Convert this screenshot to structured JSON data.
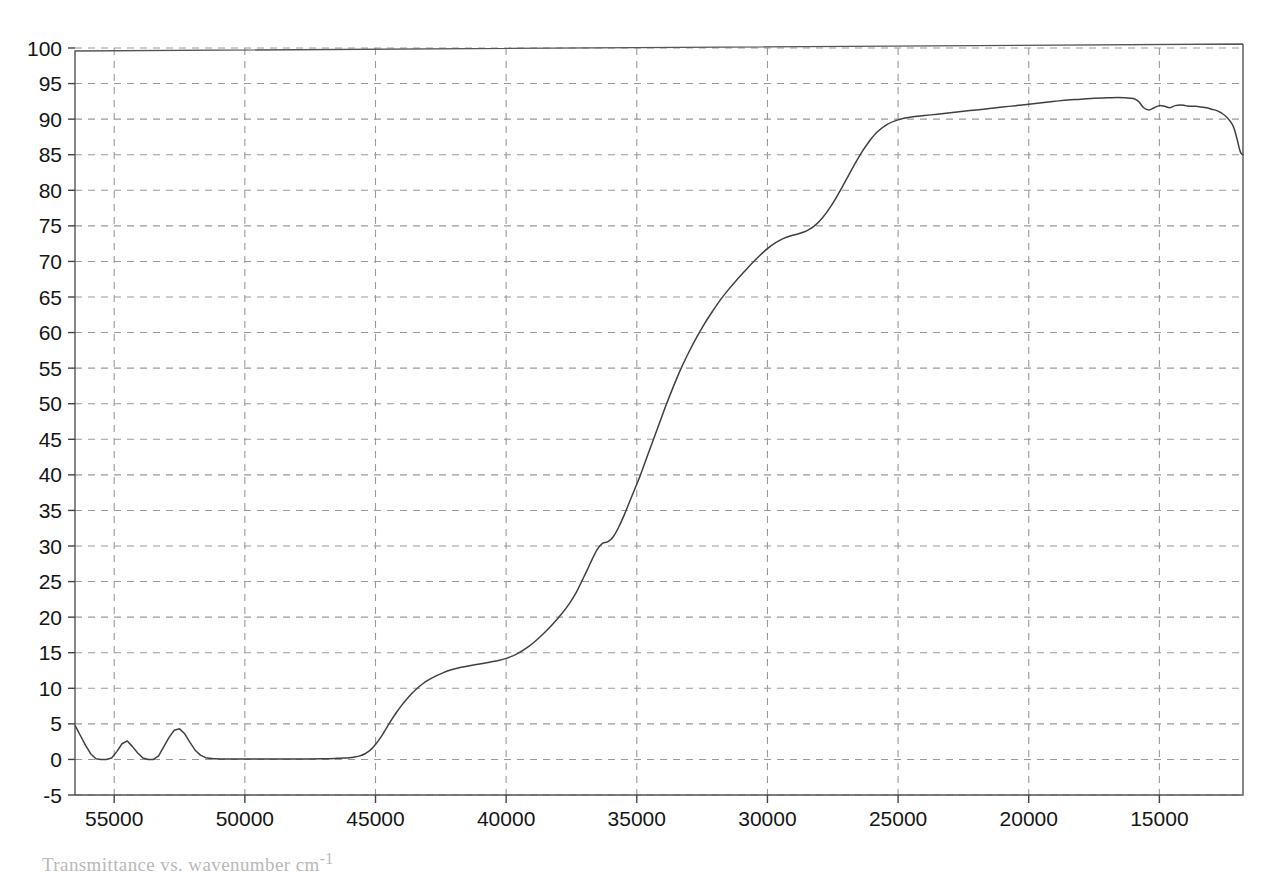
{
  "figure": {
    "background": "#ffffff",
    "caption_partial": "Transmittance vs. wavenumber cm",
    "caption_superscript": "-1"
  },
  "chart_data": {
    "type": "line",
    "title": "",
    "xlabel": "",
    "ylabel": "",
    "xlim": [
      56500,
      11800
    ],
    "ylim": [
      -5,
      100
    ],
    "x_axis_reversed": true,
    "grid": true,
    "grid_color": "#9a9a9a",
    "grid_style": "dashed",
    "legend_position": "none",
    "line_color": "#404040",
    "line_width": 1.5,
    "xticks": [
      55000,
      50000,
      45000,
      40000,
      35000,
      30000,
      25000,
      20000,
      15000
    ],
    "xtick_labels": [
      "55000",
      "50000",
      "45000",
      "40000",
      "35000",
      "30000",
      "25000",
      "20000",
      "15000"
    ],
    "yticks": [
      -5,
      0,
      5,
      10,
      15,
      20,
      25,
      30,
      35,
      40,
      45,
      50,
      55,
      60,
      65,
      70,
      75,
      80,
      85,
      90,
      95,
      100
    ],
    "ytick_labels": [
      "-5",
      "0",
      "5",
      "10",
      "15",
      "20",
      "25",
      "30",
      "35",
      "40",
      "45",
      "50",
      "55",
      "60",
      "65",
      "70",
      "75",
      "80",
      "85",
      "90",
      "95",
      "100"
    ],
    "series": [
      {
        "name": "transmittance",
        "x": [
          56500,
          56300,
          56100,
          55900,
          55700,
          55500,
          55300,
          55100,
          54900,
          54700,
          54500,
          54300,
          54100,
          53900,
          53700,
          53500,
          53300,
          53100,
          52900,
          52700,
          52500,
          52300,
          52100,
          51900,
          51700,
          51500,
          51200,
          50800,
          50400,
          50000,
          49000,
          48000,
          47000,
          46500,
          46200,
          46000,
          45800,
          45600,
          45400,
          45200,
          45000,
          44800,
          44600,
          44400,
          44200,
          44000,
          43800,
          43600,
          43400,
          43200,
          43000,
          42700,
          42400,
          42100,
          41800,
          41500,
          41200,
          40900,
          40600,
          40300,
          40000,
          39600,
          39200,
          38800,
          38400,
          38000,
          37600,
          37300,
          37100,
          36900,
          36700,
          36500,
          36300,
          36100,
          35900,
          35700,
          35500,
          35300,
          35100,
          34900,
          34700,
          34500,
          34300,
          34100,
          33900,
          33600,
          33300,
          33000,
          32700,
          32400,
          32100,
          31800,
          31500,
          31200,
          30900,
          30600,
          30300,
          30000,
          29700,
          29400,
          29100,
          28800,
          28500,
          28200,
          27900,
          27600,
          27300,
          27000,
          26700,
          26400,
          26100,
          25800,
          25400,
          25000,
          24500,
          24000,
          23500,
          23000,
          22500,
          22000,
          21500,
          21000,
          20500,
          20000,
          19500,
          19000,
          18500,
          18000,
          17500,
          17000,
          16600,
          16300,
          16000,
          15800,
          15600,
          15400,
          15200,
          15000,
          14800,
          14600,
          14400,
          14200,
          14000,
          13800,
          13600,
          13400,
          13200,
          13000,
          12800,
          12600,
          12400,
          12200,
          12100,
          12000,
          11950,
          11900,
          11850,
          11800
        ],
        "y": [
          4.8,
          3.4,
          2.0,
          0.8,
          0.1,
          0.0,
          0.0,
          0.2,
          1.1,
          2.2,
          2.6,
          1.8,
          0.9,
          0.2,
          0.0,
          0.0,
          0.5,
          1.8,
          3.1,
          4.1,
          4.3,
          3.6,
          2.4,
          1.3,
          0.6,
          0.25,
          0.1,
          0.05,
          0.05,
          0.05,
          0.05,
          0.05,
          0.1,
          0.15,
          0.2,
          0.25,
          0.35,
          0.5,
          0.8,
          1.3,
          2.1,
          3.1,
          4.3,
          5.5,
          6.6,
          7.6,
          8.5,
          9.3,
          10.0,
          10.6,
          11.1,
          11.7,
          12.2,
          12.6,
          12.9,
          13.1,
          13.3,
          13.5,
          13.7,
          13.9,
          14.2,
          14.8,
          15.7,
          16.9,
          18.3,
          19.9,
          21.8,
          23.6,
          25.1,
          26.6,
          28.2,
          29.6,
          30.4,
          30.6,
          31.3,
          32.6,
          34.2,
          36.0,
          37.8,
          39.6,
          41.6,
          43.6,
          45.6,
          47.6,
          49.6,
          52.4,
          55.0,
          57.3,
          59.4,
          61.3,
          63.0,
          64.6,
          66.0,
          67.3,
          68.5,
          69.7,
          70.8,
          71.8,
          72.6,
          73.2,
          73.6,
          73.9,
          74.3,
          75.0,
          76.1,
          77.6,
          79.4,
          81.4,
          83.4,
          85.3,
          86.9,
          88.2,
          89.3,
          89.9,
          90.3,
          90.5,
          90.7,
          90.9,
          91.1,
          91.3,
          91.5,
          91.7,
          91.9,
          92.1,
          92.3,
          92.5,
          92.7,
          92.8,
          92.95,
          93.0,
          93.05,
          93.0,
          92.9,
          92.5,
          91.6,
          91.3,
          91.6,
          91.9,
          91.8,
          91.6,
          91.9,
          92.0,
          91.9,
          91.8,
          91.8,
          91.7,
          91.6,
          91.4,
          91.2,
          90.8,
          90.2,
          89.2,
          88.2,
          86.8,
          86.0,
          85.4,
          85.1,
          85.0
        ]
      }
    ]
  }
}
